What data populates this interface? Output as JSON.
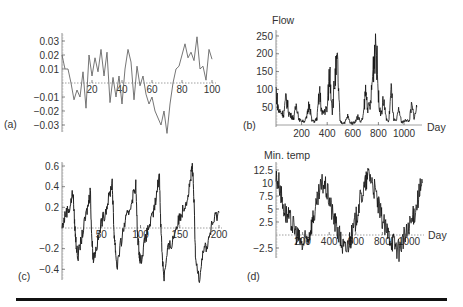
{
  "figure": {
    "panels": [
      {
        "id": "a",
        "label": "(a)",
        "ylabel": "",
        "xlabel": ""
      },
      {
        "id": "b",
        "label": "(b)",
        "ylabel": "Flow",
        "xlabel": "Day"
      },
      {
        "id": "c",
        "label": "(c)",
        "ylabel": "",
        "xlabel": ""
      },
      {
        "id": "d",
        "label": "(d)",
        "ylabel": "Min. temp",
        "xlabel": "Day"
      }
    ]
  },
  "chart_data": [
    {
      "type": "line",
      "panel": "(a)",
      "title": "",
      "xlabel": "",
      "ylabel": "",
      "xlim": [
        0,
        100
      ],
      "ylim": [
        -0.035,
        0.035
      ],
      "xticks": [
        20,
        40,
        60,
        80,
        100
      ],
      "yticks": [
        -0.03,
        -0.02,
        -0.01,
        0.01,
        0.02,
        0.03
      ],
      "grid": false,
      "color": "#666666",
      "x": [
        0,
        2,
        4,
        6,
        8,
        10,
        12,
        14,
        16,
        18,
        20,
        22,
        24,
        26,
        28,
        30,
        32,
        34,
        36,
        38,
        40,
        42,
        44,
        46,
        48,
        50,
        52,
        54,
        56,
        58,
        60,
        62,
        64,
        66,
        68,
        70,
        72,
        74,
        76,
        78,
        80,
        82,
        84,
        86,
        88,
        90,
        92,
        94,
        96,
        98,
        100
      ],
      "values": [
        0.02,
        0.01,
        0.01,
        0.0,
        -0.012,
        -0.005,
        -0.01,
        0.008,
        -0.018,
        0.02,
        0.005,
        0.018,
        0.008,
        0.024,
        0.005,
        0.022,
        -0.014,
        0.004,
        -0.01,
        0.005,
        -0.015,
        0.01,
        0.024,
        0.015,
        -0.012,
        0.012,
        -0.002,
        0.005,
        -0.008,
        -0.015,
        -0.01,
        -0.02,
        -0.025,
        -0.03,
        -0.02,
        -0.036,
        -0.015,
        0.0,
        0.01,
        0.012,
        0.02,
        0.028,
        0.018,
        0.022,
        0.016,
        0.033,
        0.01,
        0.012,
        0.002,
        0.024,
        0.017
      ]
    },
    {
      "type": "line",
      "panel": "(b)",
      "title": "",
      "xlabel": "Day",
      "ylabel": "Flow",
      "xlim": [
        0,
        1100
      ],
      "ylim": [
        0,
        260
      ],
      "xticks": [
        200,
        400,
        600,
        800,
        1000
      ],
      "yticks": [
        50,
        100,
        150,
        200,
        250
      ],
      "grid": false,
      "color": "#111111",
      "x": [
        0,
        20,
        40,
        60,
        80,
        100,
        120,
        140,
        160,
        180,
        200,
        220,
        240,
        260,
        280,
        300,
        320,
        340,
        360,
        380,
        400,
        420,
        440,
        460,
        480,
        500,
        520,
        540,
        560,
        580,
        600,
        620,
        640,
        660,
        680,
        700,
        720,
        740,
        760,
        780,
        800,
        820,
        840,
        860,
        880,
        900,
        920,
        940,
        960,
        980,
        1000,
        1020,
        1040,
        1060,
        1080,
        1100
      ],
      "values": [
        100,
        40,
        35,
        30,
        80,
        35,
        25,
        20,
        60,
        15,
        12,
        10,
        20,
        65,
        12,
        10,
        18,
        95,
        30,
        40,
        45,
        155,
        40,
        130,
        170,
        10,
        5,
        8,
        25,
        6,
        5,
        10,
        25,
        8,
        20,
        95,
        45,
        60,
        165,
        250,
        80,
        30,
        70,
        20,
        8,
        100,
        15,
        10,
        45,
        8,
        10,
        15,
        10,
        55,
        20,
        50
      ]
    },
    {
      "type": "line",
      "panel": "(c)",
      "title": "",
      "xlabel": "",
      "ylabel": "",
      "xlim": [
        0,
        200
      ],
      "ylim": [
        -0.48,
        0.62
      ],
      "xticks": [
        50,
        100,
        150,
        200
      ],
      "yticks": [
        -0.4,
        -0.2,
        0.2,
        0.4,
        0.6
      ],
      "grid": false,
      "color": "#222222",
      "x": [
        0,
        5,
        10,
        14,
        16,
        18,
        20,
        25,
        30,
        34,
        36,
        38,
        40,
        45,
        50,
        55,
        60,
        64,
        66,
        68,
        70,
        75,
        80,
        85,
        90,
        94,
        96,
        98,
        100,
        105,
        110,
        115,
        120,
        124,
        126,
        128,
        130,
        135,
        140,
        145,
        150,
        155,
        160,
        164,
        166,
        168,
        170,
        175,
        180,
        185,
        190,
        195,
        200
      ],
      "values": [
        0.0,
        0.15,
        0.2,
        0.35,
        0.05,
        -0.15,
        -0.28,
        -0.1,
        0.1,
        0.25,
        0.38,
        -0.1,
        -0.3,
        -0.15,
        0.05,
        0.15,
        0.3,
        0.45,
        0.0,
        -0.2,
        -0.38,
        -0.15,
        0.05,
        0.15,
        0.3,
        0.42,
        -0.05,
        -0.2,
        -0.33,
        -0.15,
        0.0,
        0.1,
        0.28,
        0.55,
        0.0,
        -0.3,
        -0.48,
        -0.2,
        -0.15,
        0.0,
        0.1,
        0.2,
        0.3,
        0.48,
        0.6,
        0.3,
        -0.3,
        -0.48,
        -0.2,
        -0.18,
        0.0,
        0.1,
        0.15
      ]
    },
    {
      "type": "line",
      "panel": "(d)",
      "title": "",
      "xlabel": "Day",
      "ylabel": "Min. temp",
      "xlim": [
        0,
        1100
      ],
      "ylim": [
        -4,
        13
      ],
      "xticks": [
        200,
        400,
        600,
        800,
        1000
      ],
      "yticks": [
        -2.5,
        2.5,
        5,
        7.5,
        10,
        12.5
      ],
      "grid": false,
      "color": "#111111",
      "x": [
        0,
        25,
        50,
        75,
        100,
        125,
        150,
        175,
        200,
        225,
        250,
        275,
        300,
        325,
        350,
        375,
        400,
        425,
        450,
        475,
        500,
        525,
        550,
        575,
        600,
        625,
        650,
        675,
        700,
        725,
        750,
        775,
        800,
        825,
        850,
        875,
        900,
        925,
        950,
        975,
        1000,
        1025,
        1050,
        1075,
        1100
      ],
      "values": [
        11,
        10,
        6,
        4,
        3,
        2,
        0.5,
        -1,
        -2,
        -1,
        0,
        3,
        5,
        8,
        10,
        9,
        7,
        4,
        2,
        0,
        -2,
        -3,
        -1,
        0,
        3,
        6,
        8,
        10,
        12,
        10,
        8,
        5,
        3,
        1,
        0,
        -1,
        -2,
        -3,
        -1,
        0,
        1,
        3,
        5,
        8,
        10
      ]
    }
  ],
  "footer": {
    "rule": "horizontal-rule"
  }
}
